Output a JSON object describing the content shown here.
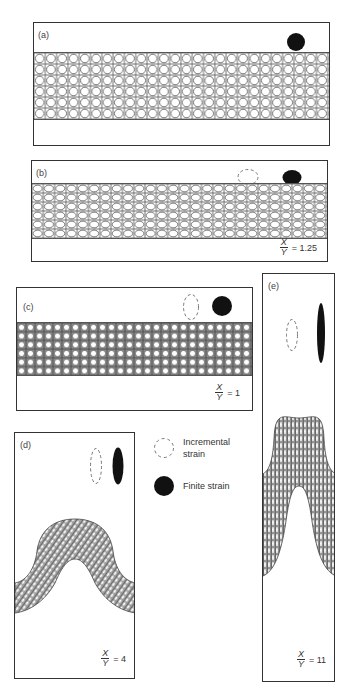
{
  "figure": {
    "panels": [
      {
        "id": "a",
        "label": "(a)",
        "ratio_num": "",
        "ratio_den": "",
        "ratio_value": ""
      },
      {
        "id": "b",
        "label": "(b)",
        "ratio_num": "X",
        "ratio_den": "Y",
        "ratio_value": "= 1.25"
      },
      {
        "id": "c",
        "label": "(c)",
        "ratio_num": "X",
        "ratio_den": "Y",
        "ratio_value": "= 1"
      },
      {
        "id": "d",
        "label": "(d)",
        "ratio_num": "X",
        "ratio_den": "Y",
        "ratio_value": "= 4"
      },
      {
        "id": "e",
        "label": "(e)",
        "ratio_num": "X",
        "ratio_den": "Y",
        "ratio_value": "= 11"
      }
    ],
    "legend": {
      "incremental": "Incremental strain",
      "incremental_line1": "Incremental",
      "incremental_line2": "strain",
      "finite": "Finite strain"
    },
    "colors": {
      "ink": "#111111",
      "grid": "#555555",
      "frame": "#333333",
      "dashed": "#777777"
    }
  }
}
